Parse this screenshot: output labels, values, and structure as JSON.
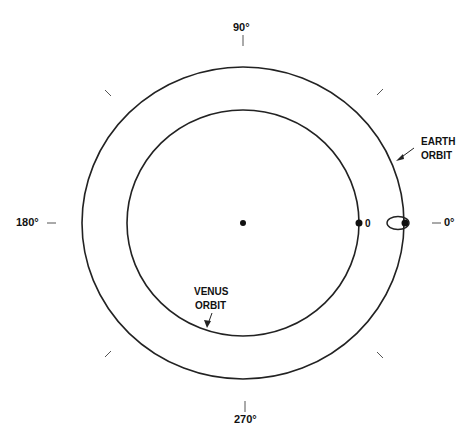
{
  "diagram": {
    "colors": {
      "stroke": "#222222",
      "text": "#111111",
      "background": "#ffffff"
    },
    "center": {
      "x": 243,
      "y": 223
    },
    "orbits": [
      {
        "name": "earth",
        "label_line1": "EARTH",
        "label_line2": "ORBIT",
        "rx": 161,
        "ry": 156
      },
      {
        "name": "venus",
        "label_line1": "VENUS",
        "label_line2": "ORBIT",
        "rx": 116,
        "ry": 113
      }
    ],
    "angle_labels": {
      "deg0": "0°",
      "deg90": "90°",
      "deg180": "180°",
      "deg270": "270°"
    },
    "venus_marker_label": "0",
    "caption": ""
  }
}
